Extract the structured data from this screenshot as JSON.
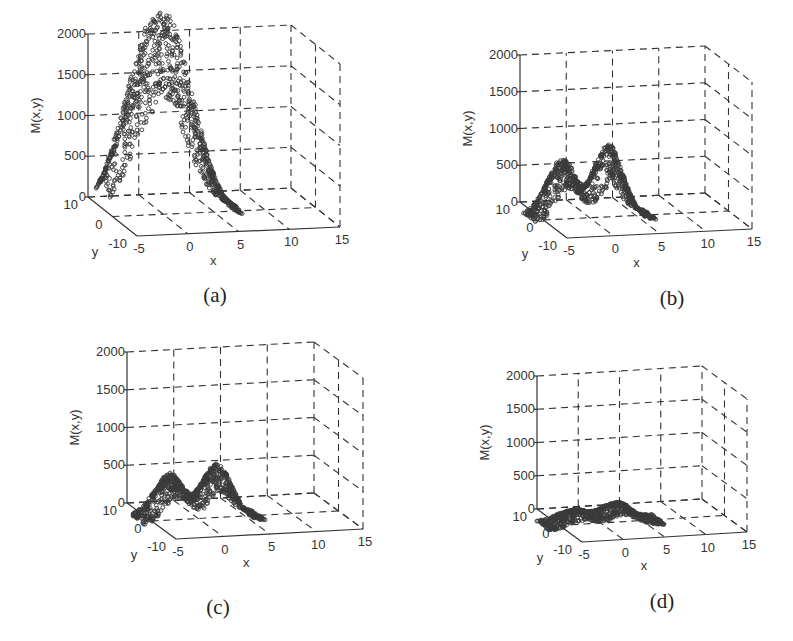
{
  "figure": {
    "background": "#ffffff",
    "marker_color": "#3a3a3a",
    "grid_color": "#333333"
  },
  "chart_data": [
    {
      "id": "a",
      "type": "scatter",
      "caption": "(a)",
      "title": "",
      "xlabel": "x",
      "ylabel": "y",
      "zlabel": "M(x,y)",
      "xticks": [
        -5,
        0,
        5,
        10,
        15
      ],
      "yticks": [
        -10,
        0,
        10
      ],
      "zticks": [
        0,
        500,
        1000,
        1500,
        2000
      ],
      "xlim": [
        -5,
        15
      ],
      "ylim": [
        -10,
        10
      ],
      "zlim": [
        0,
        2000
      ],
      "grid": true,
      "description": "Single broad hump, max approx 1700 near x≈1",
      "peaks": [
        {
          "x": -2.2,
          "h": 1580,
          "s": 2.4
        },
        {
          "x": 1.2,
          "h": 1700,
          "s": 2.3
        }
      ],
      "x_range": [
        -6,
        7.2
      ],
      "y_range": [
        -3,
        3
      ],
      "projection": {
        "origin": [
          88,
          197
        ],
        "ex": [
          203,
          -9
        ],
        "ey": [
          49,
          39
        ],
        "ez": [
          0,
          -163
        ]
      },
      "caption_pos": [
        215,
        302
      ]
    },
    {
      "id": "b",
      "type": "scatter",
      "caption": "(b)",
      "title": "",
      "xlabel": "x",
      "ylabel": "y",
      "zlabel": "M(x,y)",
      "xticks": [
        -5,
        0,
        5,
        10,
        15
      ],
      "yticks": [
        -10,
        0,
        10
      ],
      "zticks": [
        0,
        500,
        1000,
        1500,
        2000
      ],
      "xlim": [
        -5,
        15
      ],
      "ylim": [
        -10,
        10
      ],
      "zlim": [
        0,
        2000
      ],
      "grid": true,
      "description": "Two peaks: approx 830 near x≈-3 and approx 1000 near x≈2",
      "peaks": [
        {
          "x": -3.0,
          "h": 830,
          "s": 1.5
        },
        {
          "x": 2.0,
          "h": 1000,
          "s": 1.5
        }
      ],
      "x_range": [
        -6.5,
        6.5
      ],
      "y_range": [
        -3,
        3
      ],
      "projection": {
        "origin": [
          520,
          202
        ],
        "ex": [
          185,
          -9
        ],
        "ey": [
          47,
          36
        ],
        "ez": [
          0,
          -147
        ]
      },
      "caption_pos": [
        672,
        305
      ]
    },
    {
      "id": "c",
      "type": "scatter",
      "caption": "(c)",
      "title": "",
      "xlabel": "x",
      "ylabel": "y",
      "zlabel": "M(x,y)",
      "xticks": [
        -5,
        0,
        5,
        10,
        15
      ],
      "yticks": [
        -10,
        0,
        10
      ],
      "zticks": [
        0,
        500,
        1000,
        1500,
        2000
      ],
      "xlim": [
        -5,
        15
      ],
      "ylim": [
        -10,
        10
      ],
      "zlim": [
        0,
        2000
      ],
      "grid": true,
      "description": "Two peaks: approx 620 near x≈-3 and approx 720 near x≈2",
      "peaks": [
        {
          "x": -3.0,
          "h": 620,
          "s": 1.5
        },
        {
          "x": 2.0,
          "h": 720,
          "s": 1.5
        }
      ],
      "x_range": [
        -6.5,
        6.5
      ],
      "y_range": [
        -3,
        3
      ],
      "projection": {
        "origin": [
          127,
          503
        ],
        "ex": [
          187,
          -10
        ],
        "ey": [
          49,
          36
        ],
        "ez": [
          0,
          -151
        ]
      },
      "caption_pos": [
        218,
        614
      ]
    },
    {
      "id": "d",
      "type": "scatter",
      "caption": "(d)",
      "title": "",
      "xlabel": "x",
      "ylabel": "y",
      "zlabel": "M(x,y)",
      "xticks": [
        -5,
        0,
        5,
        10,
        15
      ],
      "yticks": [
        -10,
        0,
        10
      ],
      "zticks": [
        0,
        500,
        1000,
        1500,
        2000
      ],
      "xlim": [
        -5,
        15
      ],
      "ylim": [
        -10,
        10
      ],
      "zlim": [
        0,
        2000
      ],
      "grid": true,
      "description": "Two low peaks: approx 220 near x≈-3 and approx 300 near x≈2",
      "peaks": [
        {
          "x": -3.0,
          "h": 220,
          "s": 1.7
        },
        {
          "x": 2.0,
          "h": 300,
          "s": 1.7
        }
      ],
      "x_range": [
        -7,
        7
      ],
      "y_range": [
        -3,
        3
      ],
      "projection": {
        "origin": [
          537,
          509
        ],
        "ex": [
          165,
          -10
        ],
        "ey": [
          45,
          33
        ],
        "ez": [
          0,
          -133
        ]
      },
      "caption_pos": [
        662,
        608
      ]
    }
  ]
}
